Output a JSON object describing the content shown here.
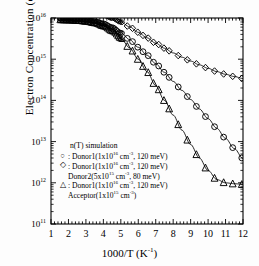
{
  "chart_data": {
    "type": "line",
    "title": "",
    "xlabel": "1000/T  (K-1)",
    "xlabel_base": "1000/T  (K",
    "xlabel_sup": "-1",
    "xlabel_tail": ")",
    "ylabel_base": "Electron Concentration  (cm",
    "ylabel_sup": "-3",
    "ylabel_tail": ")",
    "xlim": [
      1,
      12
    ],
    "ylim": [
      100000000000.0,
      1e+16
    ],
    "yscale": "log",
    "xscale": "linear",
    "grid": false,
    "legend_position": "lower-left-inside",
    "xticks": [
      "1",
      "2",
      "3",
      "4",
      "5",
      "6",
      "7",
      "8",
      "9",
      "10",
      "11",
      "12"
    ],
    "xtick_values": [
      1,
      2,
      3,
      4,
      5,
      6,
      7,
      8,
      9,
      10,
      11,
      12
    ],
    "ytick_exponents": [
      11,
      12,
      13,
      14,
      15,
      16
    ],
    "ytick_mantissa": "10",
    "series": [
      {
        "name": "Donor1(1x10^16 cm-3, 120 meV)",
        "marker": "circle",
        "x": [
          1.5,
          2.0,
          2.5,
          3.0,
          3.5,
          4.0,
          4.5,
          5.0,
          5.5,
          6.0,
          6.5,
          7.0,
          7.5,
          8.0,
          8.5,
          9.0,
          9.5,
          10.0,
          10.5,
          11.0,
          11.5,
          12.0
        ],
        "y": [
          9600000000000000.0,
          9500000000000000.0,
          9300000000000000.0,
          9000000000000000.0,
          8400000000000000.0,
          7400000000000000.0,
          6000000000000000.0,
          4400000000000000.0,
          3000000000000000.0,
          1950000000000000.0,
          1250000000000000.0,
          780000000000000.0,
          480000000000000.0,
          290000000000000.0,
          175000000000000.0,
          105000000000000.0,
          62000000000000.0,
          36000000000000.0,
          21000000000000.0,
          12000000000000.0,
          6800000000000.0,
          3900000000000.0
        ]
      },
      {
        "name": "Donor1(1x10^16 cm-3, 120 meV) + Donor2(5x10^15 cm-3, 80 meV)",
        "marker": "diamond",
        "x": [
          1.5,
          2.0,
          2.5,
          3.0,
          3.5,
          4.0,
          4.5,
          5.0,
          5.5,
          6.0,
          6.5,
          7.0,
          7.5,
          8.0,
          8.5,
          9.0,
          9.5,
          10.0,
          10.5,
          11.0,
          11.5,
          12.0
        ],
        "y": [
          1.45e+16,
          1.44e+16,
          1.42e+16,
          1.38e+16,
          1.3e+16,
          1.18e+16,
          1e+16,
          8000000000000000.0,
          6100000000000000.0,
          4500000000000000.0,
          3300000000000000.0,
          2450000000000000.0,
          1850000000000000.0,
          1420000000000000.0,
          1120000000000000.0,
          900000000000000.0,
          730000000000000.0,
          600000000000000.0,
          500000000000000.0,
          430000000000000.0,
          380000000000000.0,
          340000000000000.0
        ]
      },
      {
        "name": "Donor1(1x10^16 cm-3, 120 meV) + Acceptor(1x10^15 cm-3)",
        "marker": "triangle",
        "x": [
          1.5,
          2.0,
          2.5,
          3.0,
          3.5,
          4.0,
          4.5,
          5.0,
          5.5,
          6.0,
          6.5,
          7.0,
          7.5,
          8.0,
          8.5,
          9.0,
          9.5,
          10.0,
          10.5,
          11.0,
          11.5,
          12.0
        ],
        "y": [
          8900000000000000.0,
          8800000000000000.0,
          8600000000000000.0,
          8200000000000000.0,
          7500000000000000.0,
          6300000000000000.0,
          4800000000000000.0,
          3200000000000000.0,
          1900000000000000.0,
          1000000000000000.0,
          500000000000000.0,
          230000000000000.0,
          100000000000000.0,
          44000000000000.0,
          19000000000000.0,
          8500000000000.0,
          4000000000000.0,
          2000000000000.0,
          1200000000000.0,
          1000000000000.0,
          950000000000.0,
          920000000000.0
        ]
      }
    ]
  },
  "legend": {
    "title": "n(T) simulation",
    "entries": [
      {
        "marker": "circle",
        "lines": [
          {
            "sep": ": ",
            "text": "Donor1(1x10",
            "sup": "16",
            "mid": " cm",
            "sup2": "-3",
            "tail": ", 120 meV)"
          }
        ]
      },
      {
        "marker": "diamond",
        "lines": [
          {
            "sep": ": ",
            "text": "Donor1(1x10",
            "sup": "16",
            "mid": " cm",
            "sup2": "-3",
            "tail": ", 120 meV)"
          },
          {
            "sep": "",
            "text": "Donor2(5x10",
            "sup": "15",
            "mid": " cm",
            "sup2": "-3",
            "tail": ",   80 meV)"
          }
        ]
      },
      {
        "marker": "triangle",
        "lines": [
          {
            "sep": ": ",
            "text": "Donor1(1x10",
            "sup": "16",
            "mid": " cm",
            "sup2": "-3",
            "tail": ", 120 meV)"
          },
          {
            "sep": "",
            "text": "Acceptor(1x10",
            "sup": "15",
            "mid": " cm",
            "sup2": "-3",
            "tail": ")"
          }
        ]
      }
    ]
  },
  "style": {
    "axis_color": "#000000",
    "marker_color": "#000000",
    "background": "#ffffff"
  }
}
